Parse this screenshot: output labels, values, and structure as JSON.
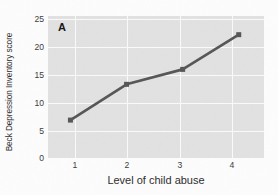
{
  "chart_data": {
    "type": "line",
    "title": "",
    "panel_label": "A",
    "xlabel": "Level of child abuse",
    "ylabel": "Beck Depression Inventory score",
    "x": [
      1,
      2,
      3,
      4
    ],
    "xtick_labels": [
      "1",
      "2",
      "3",
      "4"
    ],
    "ytick_labels": [
      "0",
      "5",
      "10",
      "15",
      "20",
      "25"
    ],
    "yticks": [
      0,
      5,
      10,
      15,
      20,
      25
    ],
    "xlim": [
      0.6,
      4.45
    ],
    "ylim": [
      -0.6,
      26.0
    ],
    "grid": true,
    "legend": "none",
    "series": [
      {
        "name": "Beck Depression Inventory score",
        "values": [
          6.5,
          13.2,
          16.0,
          22.5
        ],
        "color": "#555555",
        "marker": "square",
        "line_width": 2.6
      }
    ],
    "plot_background": "#e2e2e2",
    "gridline_color": "#fbfbfb",
    "figure_background": "#fdfdfd"
  }
}
